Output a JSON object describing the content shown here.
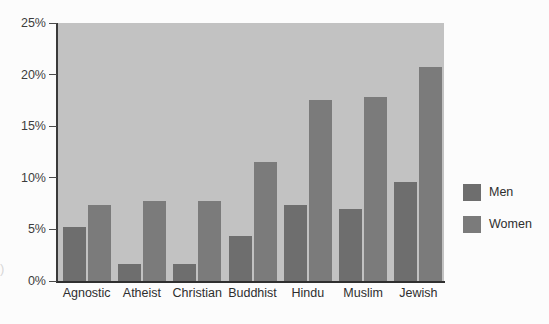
{
  "chart_data": {
    "type": "bar",
    "title": "",
    "subtitle": "",
    "xlabel": "",
    "ylabel": "",
    "categories": [
      "Agnostic",
      "Atheist",
      "Christian",
      "Buddhist",
      "Hindu",
      "Muslim",
      "Jewish"
    ],
    "series": [
      {
        "name": "Men",
        "color": "#6e6e6e",
        "values": [
          5.2,
          1.65,
          1.65,
          4.4,
          7.4,
          7.0,
          9.6
        ]
      },
      {
        "name": "Women",
        "color": "#7b7b7b",
        "values": [
          7.4,
          7.8,
          7.8,
          11.5,
          17.5,
          17.8,
          20.7
        ]
      }
    ],
    "ylim": [
      0,
      25
    ],
    "ytick_values": [
      0,
      5,
      10,
      15,
      20,
      25
    ],
    "ytick_labels": [
      "0%",
      "5%",
      "10%",
      "15%",
      "20%",
      "25%"
    ],
    "grid": false,
    "legend_position": "right",
    "legend_entries": [
      "Men",
      "Women"
    ],
    "plot_background": "#c2c2c2",
    "figure_background": "#fcfcfc",
    "axis_color": "#333333",
    "annotations": []
  },
  "edge_artifact": {
    "text": ")"
  }
}
